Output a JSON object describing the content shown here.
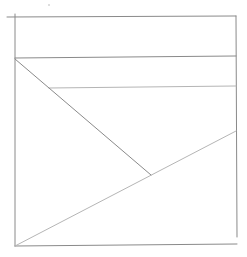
{
  "image": {
    "description": "Hand-drawn pencil sketch of a square divided by horizontal lines and two diagonals",
    "width": 247,
    "height": 257,
    "background": "#ffffff",
    "stroke_color": "#8a8a8a",
    "stroke_color_light": "#b5b5b5"
  },
  "lines": [
    {
      "name": "top-edge",
      "x1": 7,
      "y1": 17,
      "x2": 236,
      "y2": 16
    },
    {
      "name": "left-edge",
      "x1": 15,
      "y1": 14,
      "x2": 15,
      "y2": 246
    },
    {
      "name": "right-edge",
      "x1": 236,
      "y1": 16,
      "x2": 237,
      "y2": 237
    },
    {
      "name": "bottom-edge",
      "x1": 15,
      "y1": 246,
      "x2": 237,
      "y2": 244
    },
    {
      "name": "upper-horizontal",
      "x1": 15,
      "y1": 58,
      "x2": 236,
      "y2": 56
    },
    {
      "name": "middle-horizontal",
      "x1": 49,
      "y1": 88,
      "x2": 236,
      "y2": 86
    },
    {
      "name": "diagonal-down",
      "x1": 15,
      "y1": 59,
      "x2": 151,
      "y2": 175
    },
    {
      "name": "diagonal-up",
      "x1": 15,
      "y1": 246,
      "x2": 236,
      "y2": 131
    }
  ],
  "marks": [
    {
      "name": "stray-dot",
      "cx": 49,
      "cy": 5,
      "r": 0.8
    }
  ]
}
